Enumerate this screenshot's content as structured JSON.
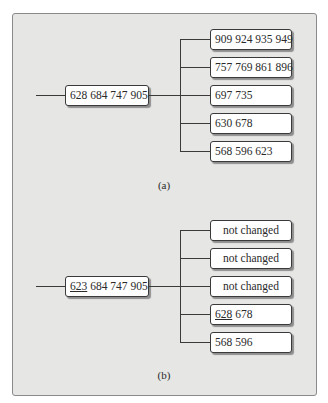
{
  "figure_a": {
    "caption": "(a)",
    "root": {
      "keys": [
        "628",
        "684",
        "747",
        "905"
      ],
      "text": "628 684 747 905"
    },
    "children": [
      {
        "text": "909 924 935 949"
      },
      {
        "text": "757 769 861 896"
      },
      {
        "text": "697 735"
      },
      {
        "text": "630 678"
      },
      {
        "text": "568 596 623"
      }
    ]
  },
  "figure_b": {
    "caption": "(b)",
    "root": {
      "underlined_key": "623",
      "rest": " 684 747 905"
    },
    "children": [
      {
        "text": "not changed"
      },
      {
        "text": "not changed"
      },
      {
        "text": "not changed"
      },
      {
        "underlined_key": "628",
        "rest": " 678"
      },
      {
        "text": "568 596"
      }
    ]
  },
  "colors": {
    "panel_bg": "#e6e6e4",
    "line": "#3a3a3a",
    "box_bg": "#ffffff"
  }
}
